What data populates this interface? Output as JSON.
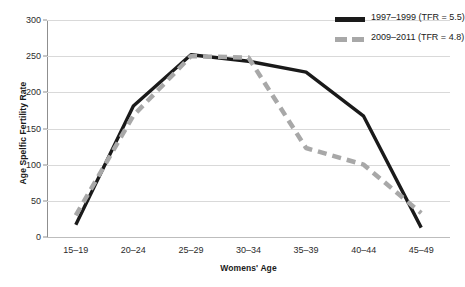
{
  "chart_data": {
    "type": "line",
    "title": "",
    "xlabel": "Womens' Age",
    "ylabel": "Age Spelfic Fertility Rate",
    "categories": [
      "15–19",
      "20–24",
      "25–29",
      "30–34",
      "35–39",
      "40–44",
      "45–49"
    ],
    "ylim": [
      0,
      300
    ],
    "yticks": [
      0,
      50,
      100,
      150,
      200,
      250,
      300
    ],
    "grid": true,
    "legend_position": "top-right",
    "series": [
      {
        "name": "1997–1999 (TFR = 5.5)",
        "values": [
          17,
          181,
          252,
          243,
          228,
          167,
          13
        ],
        "color": "#1a1a1a",
        "style": "solid"
      },
      {
        "name": "2009–2011 (TFR = 4.8)",
        "values": [
          30,
          168,
          250,
          248,
          123,
          100,
          33
        ],
        "color": "#a8a8a8",
        "style": "dashed"
      }
    ]
  },
  "legend": {
    "items": [
      {
        "label": "1997–1999 (TFR = 5.5)",
        "color": "#1a1a1a",
        "style": "solid"
      },
      {
        "label": "2009–2011 (TFR = 4.8)",
        "color": "#a8a8a8",
        "style": "dashed"
      }
    ]
  },
  "colors": {
    "series_1997": "#1a1a1a",
    "series_2009": "#a8a8a8",
    "gridline": "#d9d9d9",
    "axis": "#8f8f8f",
    "background": "#ffffff",
    "text": "#1a1a1a"
  }
}
